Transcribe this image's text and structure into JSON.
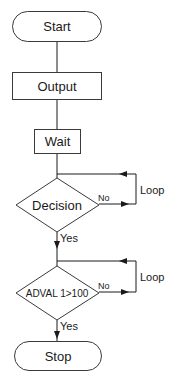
{
  "diagram": {
    "type": "flowchart",
    "nodes": [
      {
        "id": "start",
        "shape": "terminal",
        "label": "Start"
      },
      {
        "id": "output",
        "shape": "process",
        "label": "Output"
      },
      {
        "id": "wait",
        "shape": "process",
        "label": "Wait"
      },
      {
        "id": "decision1",
        "shape": "decision",
        "label": "Decision"
      },
      {
        "id": "decision2",
        "shape": "decision",
        "label": "ADVAL 1>100"
      },
      {
        "id": "stop",
        "shape": "terminal",
        "label": "Stop"
      }
    ],
    "edges": [
      {
        "from": "start",
        "to": "output",
        "label": ""
      },
      {
        "from": "output",
        "to": "wait",
        "label": ""
      },
      {
        "from": "wait",
        "to": "decision1",
        "label": ""
      },
      {
        "from": "decision1",
        "to": "decision1",
        "label": "No",
        "loop_label": "Loop"
      },
      {
        "from": "decision1",
        "to": "decision2",
        "label": "Yes"
      },
      {
        "from": "decision2",
        "to": "decision2",
        "label": "No",
        "loop_label": "Loop"
      },
      {
        "from": "decision2",
        "to": "stop",
        "label": "Yes"
      }
    ]
  },
  "labels": {
    "start": "Start",
    "output": "Output",
    "wait": "Wait",
    "decision1": "Decision",
    "decision2": "ADVAL 1>100",
    "stop": "Stop",
    "no1": "No",
    "yes1": "Yes",
    "loop1": "Loop",
    "no2": "No",
    "yes2": "Yes",
    "loop2": "Loop"
  }
}
